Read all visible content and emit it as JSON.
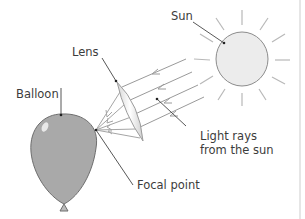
{
  "diagram": {
    "labels": {
      "sun": "Sun",
      "lens": "Lens",
      "balloon": "Balloon",
      "light_rays_line1": "Light rays",
      "light_rays_line2": "from the sun",
      "focal_point": "Focal point"
    },
    "colors": {
      "balloon_fill": "#a9a9a9",
      "sun_fill": "#ececec",
      "line": "#8a8a8a",
      "leader": "#444444",
      "text": "#3c3c3c",
      "background": "#ffffff"
    }
  }
}
